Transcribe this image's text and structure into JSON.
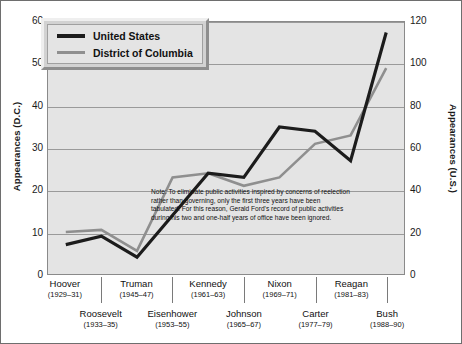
{
  "chart_data": {
    "type": "line",
    "title": "",
    "categories": [
      "Hoover",
      "Roosevelt",
      "Truman",
      "Eisenhower",
      "Kennedy",
      "Johnson",
      "Nixon",
      "Carter",
      "Reagan",
      "Bush"
    ],
    "category_years": [
      "(1929–31)",
      "(1933–35)",
      "(1945–47)",
      "(1953–55)",
      "(1961–63)",
      "(1965–67)",
      "(1969–71)",
      "(1977–79)",
      "(1981–83)",
      "(1988–90)"
    ],
    "series": [
      {
        "name": "United States",
        "axis": "right",
        "color": "#1c1c1c",
        "values_left_scale": [
          7,
          9,
          4,
          14,
          24,
          23,
          35,
          34,
          27,
          57.5
        ],
        "values": [
          14,
          18,
          8,
          28,
          48,
          46,
          70,
          68,
          54,
          115
        ]
      },
      {
        "name": "District of Columbia",
        "axis": "left",
        "color": "#8f8f8f",
        "values": [
          10,
          10.5,
          5.5,
          23,
          24,
          21,
          23,
          31,
          33,
          49
        ]
      }
    ],
    "ylabel_left": "Appearances (D.C.)",
    "ylabel_right": "Appearances (U.S.)",
    "xlabel": "",
    "ylim_left": [
      0,
      60
    ],
    "ylim_right": [
      0,
      120
    ],
    "yticks_left": [
      "0",
      "10",
      "20",
      "30",
      "40",
      "50",
      "60"
    ],
    "yticks_right": [
      "0",
      "20",
      "40",
      "60",
      "80",
      "100",
      "120"
    ],
    "grid": true,
    "legend_position": "top-left",
    "annotations": [
      "Note:  To eliminate public activities inspired by concerns of reelection rather than governing, only the first three years have been tabulated.  For this reason, Gerald Ford's record of public activities during his two and one-half years of office have been ignored."
    ]
  },
  "legend": {
    "items": [
      {
        "label": "United States",
        "color": "#1c1c1c"
      },
      {
        "label": "District of Columbia",
        "color": "#8f8f8f"
      }
    ]
  },
  "note": {
    "text": "Note:  To eliminate public activities inspired by concerns of reelection rather than governing, only the first three years have been tabulated.  For this reason, Gerald Ford's record of public activities during his two and one-half years of office have been ignored."
  },
  "colors": {
    "plot_background": "#e4e4e4",
    "gridline": "#9a9a9a",
    "us_line": "#1c1c1c",
    "dc_line": "#8f8f8f",
    "text": "#111111"
  }
}
